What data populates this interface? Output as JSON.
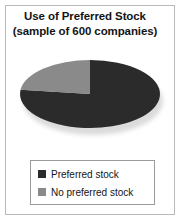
{
  "figure": {
    "title_line1": "Use of Preferred Stock",
    "title_line2": "(sample of 600 companies)",
    "frame_border_color": "#b9b9b9",
    "background_color": "#ffffff"
  },
  "legend": {
    "border_color": "#9a9a9a",
    "entries": [
      {
        "label": "Preferred stock",
        "color": "#2b2b2b",
        "swatch_name": "legend-swatch-preferred-stock"
      },
      {
        "label": "No preferred stock",
        "color": "#8a8a8a",
        "swatch_name": "legend-swatch-no-preferred-stock"
      }
    ]
  },
  "chart_data": {
    "type": "pie",
    "title": "Use of Preferred Stock (sample of 600 companies)",
    "subtitle": "(sample of 600 companies)",
    "xlabel": "",
    "ylabel": "",
    "legend_position": "bottom",
    "grid": false,
    "sample_size": 600,
    "start_angle_deg": 0,
    "direction": "clockwise",
    "categories": [
      "Preferred stock",
      "No preferred stock"
    ],
    "values": [
      77,
      23
    ],
    "value_unit": "percent",
    "colors": [
      "#2b2b2b",
      "#8a8a8a"
    ],
    "slices": [
      {
        "label": "Preferred stock",
        "value": 77,
        "percent": 77,
        "color": "#2b2b2b",
        "start_angle_deg": 83,
        "end_angle_deg": 360
      },
      {
        "label": "No preferred stock",
        "value": 23,
        "percent": 23,
        "color": "#8a8a8a",
        "start_angle_deg": 0,
        "end_angle_deg": 83
      }
    ]
  }
}
